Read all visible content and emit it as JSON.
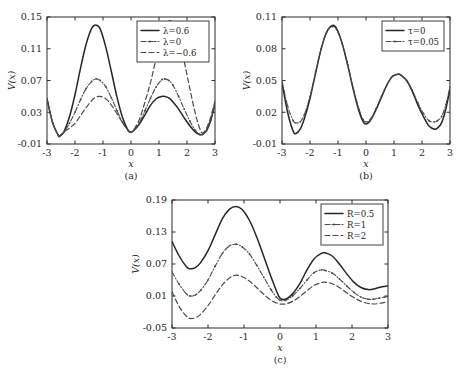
{
  "figure": {
    "background": "#ffffff",
    "curve_color": "#262626",
    "secondary_curve_color": "#4a4a4a",
    "axis_color": "#2b2b2b"
  },
  "panels": [
    {
      "id": "a",
      "panel_label": "(a)",
      "xlabel": "x",
      "ylabel": "V(x)",
      "legend_entries": [
        "λ=0.6",
        "λ=0",
        "λ=−0.6"
      ]
    },
    {
      "id": "b",
      "panel_label": "(b)",
      "xlabel": "x",
      "ylabel": "V(x)",
      "legend_entries": [
        "τ=0",
        "τ=0.05"
      ]
    },
    {
      "id": "c",
      "panel_label": "(c)",
      "xlabel": "x",
      "ylabel": "V(x)",
      "legend_entries": [
        "R=0.5",
        "R=1",
        "R=2"
      ]
    }
  ],
  "chart_data": [
    {
      "type": "line",
      "id": "a",
      "title": "",
      "panel_label": "(a)",
      "xlabel": "x",
      "ylabel": "V(x)",
      "xlim": [
        -3,
        3
      ],
      "ylim": [
        -0.01,
        0.15
      ],
      "xticks": [
        -3,
        -2,
        -1,
        0,
        1,
        2,
        3
      ],
      "xticklabels": [
        "-3",
        "-2",
        "-1",
        "0",
        "1",
        "2",
        "3"
      ],
      "yticks": [
        -0.01,
        0.03,
        0.07,
        0.11,
        0.15
      ],
      "yticklabels": [
        "-0.01",
        "0.03",
        "0.07",
        "0.11",
        "0.15"
      ],
      "grid": false,
      "legend_position": "upper-right-inside",
      "x": [
        -3,
        -2.8,
        -2.6,
        -2.55,
        -2.4,
        -2.2,
        -2,
        -1.8,
        -1.6,
        -1.4,
        -1.25,
        -1.1,
        -0.9,
        -0.7,
        -0.5,
        -0.3,
        -0.1,
        0,
        0.1,
        0.3,
        0.5,
        0.7,
        0.9,
        1.1,
        1.2,
        1.35,
        1.5,
        1.7,
        1.9,
        2.1,
        2.3,
        2.45,
        2.55,
        2.7,
        2.85,
        3
      ],
      "series": [
        {
          "name": "λ=0.6",
          "style": "solid",
          "markers": false,
          "values": [
            0.047,
            0.017,
            0.001,
            0.0,
            0.005,
            0.024,
            0.052,
            0.086,
            0.116,
            0.136,
            0.14,
            0.135,
            0.112,
            0.081,
            0.049,
            0.023,
            0.007,
            0.005,
            0.007,
            0.015,
            0.027,
            0.039,
            0.047,
            0.05,
            0.05,
            0.048,
            0.043,
            0.034,
            0.023,
            0.013,
            0.005,
            0.002,
            0.002,
            0.007,
            0.02,
            0.041
          ]
        },
        {
          "name": "λ=0",
          "style": "dash-dot",
          "markers": true,
          "values": [
            0.047,
            0.017,
            0.001,
            0.0,
            0.005,
            0.016,
            0.03,
            0.046,
            0.06,
            0.069,
            0.072,
            0.07,
            0.062,
            0.048,
            0.032,
            0.017,
            0.007,
            0.005,
            0.007,
            0.017,
            0.032,
            0.048,
            0.062,
            0.071,
            0.072,
            0.07,
            0.064,
            0.05,
            0.034,
            0.019,
            0.007,
            0.002,
            0.002,
            0.007,
            0.02,
            0.041
          ]
        },
        {
          "name": "λ=−0.6",
          "style": "dashed",
          "markers": false,
          "values": [
            0.047,
            0.017,
            0.001,
            0.0,
            0.005,
            0.01,
            0.016,
            0.026,
            0.036,
            0.045,
            0.049,
            0.05,
            0.047,
            0.039,
            0.028,
            0.017,
            0.007,
            0.005,
            0.008,
            0.021,
            0.043,
            0.068,
            0.098,
            0.126,
            0.136,
            0.145,
            0.142,
            0.124,
            0.094,
            0.06,
            0.028,
            0.01,
            0.004,
            0.01,
            0.024,
            0.044
          ]
        }
      ]
    },
    {
      "type": "line",
      "id": "b",
      "title": "",
      "panel_label": "(b)",
      "xlabel": "x",
      "ylabel": "V(x)",
      "xlim": [
        -3,
        3
      ],
      "ylim": [
        -0.01,
        0.11
      ],
      "xticks": [
        -3,
        -2,
        -1,
        0,
        1,
        2,
        3
      ],
      "xticklabels": [
        "-3",
        "-2",
        "-1",
        "0",
        "1",
        "2",
        "3"
      ],
      "yticks": [
        -0.01,
        0.02,
        0.05,
        0.08,
        0.11
      ],
      "yticklabels": [
        "-0.01",
        "0.02",
        "0.05",
        "0.08",
        "0.11"
      ],
      "grid": false,
      "legend_position": "upper-right-inside",
      "x": [
        -3,
        -2.8,
        -2.6,
        -2.5,
        -2.35,
        -2.2,
        -2,
        -1.8,
        -1.6,
        -1.4,
        -1.2,
        -1.05,
        -0.85,
        -0.65,
        -0.45,
        -0.25,
        -0.1,
        0,
        0.15,
        0.35,
        0.55,
        0.75,
        0.95,
        1.15,
        1.25,
        1.45,
        1.65,
        1.85,
        2.05,
        2.25,
        2.45,
        2.55,
        2.7,
        2.85,
        3
      ],
      "series": [
        {
          "name": "τ=0",
          "style": "solid",
          "markers": false,
          "values": [
            0.048,
            0.02,
            0.002,
            0.0,
            0.004,
            0.014,
            0.033,
            0.057,
            0.08,
            0.096,
            0.102,
            0.099,
            0.085,
            0.064,
            0.041,
            0.021,
            0.011,
            0.009,
            0.012,
            0.022,
            0.034,
            0.046,
            0.054,
            0.056,
            0.055,
            0.05,
            0.04,
            0.027,
            0.016,
            0.007,
            0.004,
            0.005,
            0.01,
            0.023,
            0.042
          ]
        },
        {
          "name": "τ=0.05",
          "style": "dash-dot",
          "markers": true,
          "values": [
            0.05,
            0.026,
            0.012,
            0.01,
            0.011,
            0.018,
            0.035,
            0.058,
            0.08,
            0.096,
            0.101,
            0.098,
            0.085,
            0.065,
            0.042,
            0.023,
            0.013,
            0.011,
            0.013,
            0.023,
            0.035,
            0.046,
            0.054,
            0.056,
            0.055,
            0.05,
            0.041,
            0.029,
            0.019,
            0.012,
            0.011,
            0.012,
            0.016,
            0.027,
            0.044
          ]
        }
      ]
    },
    {
      "type": "line",
      "id": "c",
      "title": "",
      "panel_label": "(c)",
      "xlabel": "x",
      "ylabel": "V(x)",
      "xlim": [
        -3,
        3
      ],
      "ylim": [
        -0.05,
        0.19
      ],
      "xticks": [
        -3,
        -2,
        -1,
        0,
        1,
        2,
        3
      ],
      "xticklabels": [
        "-3",
        "-2",
        "-1",
        "0",
        "1",
        "2",
        "3"
      ],
      "yticks": [
        -0.05,
        0.01,
        0.07,
        0.13,
        0.19
      ],
      "yticklabels": [
        "-0.05",
        "0.01",
        "0.07",
        "0.13",
        "0.19"
      ],
      "grid": false,
      "legend_position": "upper-right-inside",
      "x": [
        -3,
        -2.8,
        -2.6,
        -2.5,
        -2.35,
        -2.2,
        -2,
        -1.8,
        -1.6,
        -1.4,
        -1.22,
        -1.05,
        -0.85,
        -0.65,
        -0.45,
        -0.25,
        -0.1,
        0,
        0.15,
        0.35,
        0.55,
        0.75,
        0.95,
        1.15,
        1.25,
        1.45,
        1.65,
        1.85,
        2.05,
        2.25,
        2.45,
        2.6,
        2.75,
        2.9,
        3
      ],
      "series": [
        {
          "name": "R=0.5",
          "style": "solid",
          "markers": false,
          "values": [
            0.112,
            0.085,
            0.065,
            0.061,
            0.063,
            0.073,
            0.095,
            0.125,
            0.155,
            0.173,
            0.178,
            0.172,
            0.152,
            0.121,
            0.084,
            0.046,
            0.02,
            0.006,
            0.004,
            0.014,
            0.033,
            0.059,
            0.08,
            0.09,
            0.091,
            0.085,
            0.07,
            0.052,
            0.036,
            0.026,
            0.022,
            0.023,
            0.026,
            0.028,
            0.029
          ]
        },
        {
          "name": "R=1",
          "style": "dash-dot",
          "markers": true,
          "values": [
            0.055,
            0.032,
            0.014,
            0.01,
            0.012,
            0.021,
            0.04,
            0.066,
            0.09,
            0.104,
            0.107,
            0.102,
            0.089,
            0.068,
            0.045,
            0.022,
            0.008,
            0.002,
            0.002,
            0.01,
            0.024,
            0.04,
            0.054,
            0.059,
            0.058,
            0.053,
            0.042,
            0.029,
            0.017,
            0.008,
            0.004,
            0.004,
            0.006,
            0.008,
            0.009
          ]
        },
        {
          "name": "R=2",
          "style": "dashed",
          "markers": false,
          "values": [
            0.018,
            -0.01,
            -0.028,
            -0.032,
            -0.031,
            -0.024,
            -0.008,
            0.012,
            0.031,
            0.044,
            0.049,
            0.046,
            0.038,
            0.026,
            0.013,
            0.002,
            -0.003,
            -0.005,
            -0.005,
            0.0,
            0.009,
            0.02,
            0.03,
            0.035,
            0.036,
            0.033,
            0.026,
            0.016,
            0.007,
            0.0,
            -0.004,
            -0.005,
            -0.004,
            -0.002,
            -0.001
          ]
        }
      ]
    }
  ]
}
